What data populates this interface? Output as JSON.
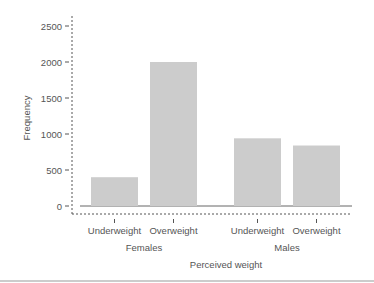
{
  "chart_data": {
    "type": "bar",
    "title": "",
    "xlabel": "Perceived weight",
    "ylabel": "Frequency",
    "ylim": [
      0,
      2500
    ],
    "yticks": [
      0,
      500,
      1000,
      1500,
      2000,
      2500
    ],
    "grid": false,
    "legend": "none",
    "groups": [
      {
        "name": "Females",
        "categories": [
          "Underweight",
          "Overweight"
        ],
        "values": [
          400,
          2000
        ]
      },
      {
        "name": "Males",
        "categories": [
          "Underweight",
          "Overweight"
        ],
        "values": [
          940,
          840
        ]
      }
    ],
    "bar_color": "#cccccc"
  }
}
